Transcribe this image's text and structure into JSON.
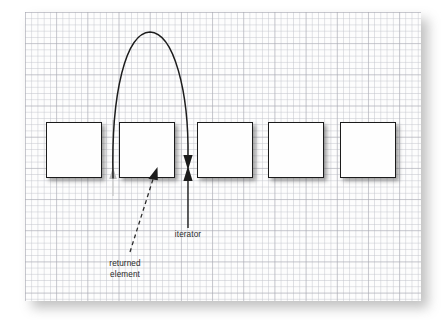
{
  "figure": {
    "type": "diagram",
    "background_color": "#ffffff",
    "canvas": {
      "name": "grid-paper-canvas",
      "fill_color": "#fdfdfd",
      "grid_minor_color": "#c4c6cd",
      "grid_major_color": "#a0a0aa",
      "grid_minor_spacing_px": 6.24,
      "grid_major_spacing_px": 31.2,
      "x": 25,
      "y": 12,
      "width": 396,
      "height": 289
    }
  },
  "elements": {
    "boxes": [
      {
        "id": "element-box-1",
        "label": "",
        "x": 46,
        "y": 122,
        "width": 56,
        "height": 56
      },
      {
        "id": "element-box-2",
        "label": "",
        "x": 119,
        "y": 122,
        "width": 56,
        "height": 56
      },
      {
        "id": "element-box-3",
        "label": "",
        "x": 197,
        "y": 122,
        "width": 56,
        "height": 56
      },
      {
        "id": "element-box-4",
        "label": "",
        "x": 268,
        "y": 122,
        "width": 56,
        "height": 56
      },
      {
        "id": "element-box-5",
        "label": "",
        "x": 340,
        "y": 122,
        "width": 56,
        "height": 56
      }
    ],
    "box_fill_color": "#fefefe",
    "box_border_color": "#1c1c1c",
    "box_shadow_color": "rgba(60,60,60,0.48)"
  },
  "annotations": {
    "iterator": {
      "label": "iterator",
      "color": "#2b2b2b",
      "pointer_line_x": 188,
      "pointer_line_top_y": 168,
      "pointer_line_bottom_y": 228,
      "arrowhead_direction": "up"
    },
    "returned_element": {
      "label": "returned\nelement",
      "line1": "returned",
      "line2": "element",
      "color": "#2b2b2b",
      "leader_style": "dashed",
      "leader_from": {
        "x": 130,
        "y": 250
      },
      "leader_to": {
        "x": 157,
        "y": 170
      },
      "arrowhead_direction": "up-right"
    },
    "advance_curve": {
      "name": "iterator-advance-curve",
      "description": "curved arrow from previous iterator position to next position",
      "color": "#1c1c1c",
      "start": {
        "x": 113,
        "y": 176
      },
      "apex": {
        "x": 150,
        "y": 32
      },
      "end": {
        "x": 188,
        "y": 160
      },
      "arrowhead_direction": "down"
    },
    "ghost_marker": {
      "name": "previous-iterator-ghost",
      "color": "#b8b8b8",
      "x": 113,
      "y": 178,
      "description": "faint gray arrowhead marking the prior iterator position"
    }
  }
}
